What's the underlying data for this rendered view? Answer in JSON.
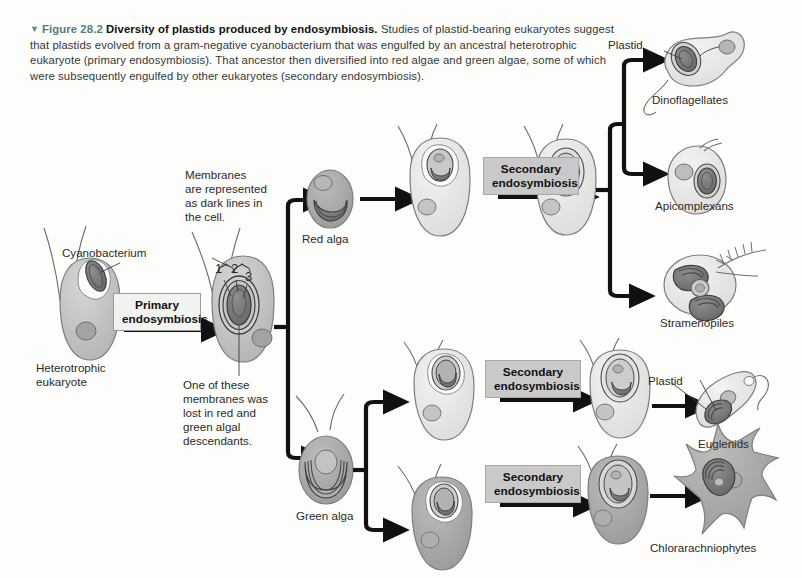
{
  "figure": {
    "marker": "▼",
    "number": "Figure 28.2",
    "title": "Diversity of plastids produced by endosymbiosis.",
    "body": "Studies of plastid-bearing eukaryotes suggest that plastids evolved from a gram-negative cyanobacterium that was engulfed by an ancestral heterotrophic eukaryote (primary endosymbiosis). That ancestor then diversified into red algae and green algae, some of which were subsequently engulfed by other eukaryotes (secondary endosymbiosis)."
  },
  "labels": {
    "cyanobacterium": "Cyanobacterium",
    "heterotrophic_eukaryote": "Heterotrophic\neukaryote",
    "heterotrophic_line1": "Heterotrophic",
    "heterotrophic_line2": "eukaryote",
    "membranes_note": "Membranes\nare represented\nas dark lines in\nthe cell.",
    "membranes_l1": "Membranes",
    "membranes_l2": "are represented",
    "membranes_l3": "as dark lines in",
    "membranes_l4": "the cell.",
    "membrane_num_1": "1",
    "membrane_num_2": "2",
    "membrane_num_3": "3",
    "lost_membrane_note": "One of these\nmembranes was\nlost in red and\ngreen algal\ndescendants.",
    "lost_l1": "One of these",
    "lost_l2": "membranes was",
    "lost_l3": "lost in red and",
    "lost_l4": "green algal",
    "lost_l5": "descendants.",
    "red_alga": "Red alga",
    "green_alga": "Green alga",
    "plastid_top": "Plastid",
    "plastid_bottom": "Plastid"
  },
  "processes": {
    "primary": "Primary\nendosymbiosis",
    "primary_l1": "Primary",
    "primary_l2": "endosymbiosis",
    "secondary": "Secondary\nendosymbiosis",
    "secondary_l1": "Secondary",
    "secondary_l2": "endosymbiosis"
  },
  "outcomes": [
    {
      "name": "Dinoflagellates"
    },
    {
      "name": "Apicomplexans"
    },
    {
      "name": "Stramenopiles"
    },
    {
      "name": "Euglenids"
    },
    {
      "name": "Chlorarachniophytes"
    }
  ],
  "outcome_names": {
    "dinoflagellates": "Dinoflagellates",
    "apicomplexans": "Apicomplexans",
    "stramenopiles": "Stramenopiles",
    "euglenids": "Euglenids",
    "chlorarachniophytes": "Chlorarachniophytes"
  },
  "colors": {
    "page_background": "#fdfdfb",
    "figure_number": "#527d80",
    "arrow": "#111111",
    "secondary_box_fill": "#c9c9c9",
    "primary_box_fill": "#f2f2f0",
    "cell_light": "#e4e4e2",
    "cell_mid": "#bdbdbb",
    "cell_dark": "#9b9b99",
    "plastid_dark": "#6e6e6c"
  }
}
